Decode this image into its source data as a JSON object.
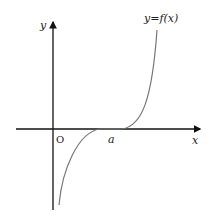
{
  "diagram": {
    "type": "function-graph",
    "axes": {
      "x_label": "x",
      "y_label": "y",
      "origin_label": "O"
    },
    "curve": {
      "label": "y=f(x)",
      "shape": "cubic-like, increasing, inflection tangent to x-axis at a",
      "color": "#777777"
    },
    "marks": {
      "point_a_label": "a"
    },
    "colors": {
      "axis": "#111111",
      "curve": "#777777",
      "text": "#222222"
    }
  }
}
